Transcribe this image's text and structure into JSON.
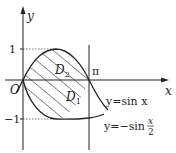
{
  "diagram": {
    "axes": {
      "x_label": "x",
      "y_label": "y",
      "origin_label": "O"
    },
    "ticks": {
      "y_pos": "1",
      "y_neg": "−1",
      "x_pi": "π"
    },
    "regions": {
      "d1_main": "D",
      "d1_sub": "1",
      "d2_main": "D",
      "d2_sub": "2"
    },
    "curves": [
      {
        "label": "y=sin x",
        "func": "sin"
      },
      {
        "label_prefix": "y=−sin",
        "frac_num": "x",
        "frac_den": "2",
        "func": "neg_sin_half"
      }
    ],
    "colors": {
      "stroke": "#222222",
      "hatch": "#555555",
      "dotted": "#555555"
    }
  }
}
